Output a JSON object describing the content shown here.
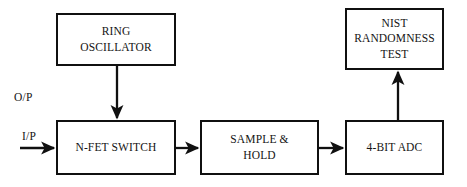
{
  "diagram": {
    "stroke_color": "#101010",
    "background_color": "#ffffff",
    "text_color": "#141414",
    "blocks": [
      {
        "id": "ring-oscillator",
        "label": "RING\nOSCILLATOR",
        "x": 56,
        "y": 13,
        "w": 120,
        "h": 53
      },
      {
        "id": "nist-randomness-test",
        "label": "NIST\nRANDOMNESS\nTEST",
        "x": 345,
        "y": 8,
        "w": 99,
        "h": 62
      },
      {
        "id": "n-fet-switch",
        "label": "N-FET SWITCH",
        "x": 56,
        "y": 120,
        "w": 120,
        "h": 55
      },
      {
        "id": "sample-and-hold",
        "label": "SAMPLE &\nHOLD",
        "x": 200,
        "y": 120,
        "w": 119,
        "h": 55
      },
      {
        "id": "four-bit-adc",
        "label": "4-BIT ADC",
        "x": 345,
        "y": 120,
        "w": 99,
        "h": 55
      }
    ],
    "edge_labels": [
      {
        "id": "output-label",
        "text": "O/P",
        "x": 14,
        "y": 91
      },
      {
        "id": "input-label",
        "text": "I/P",
        "x": 22,
        "y": 130
      }
    ],
    "connectors": [
      {
        "id": "input-to-n-fet-switch",
        "type": "arrow-right"
      },
      {
        "id": "ring-oscillator-to-n-fet-switch",
        "type": "arrow-down"
      },
      {
        "id": "n-fet-switch-to-sample-and-hold",
        "type": "arrow-right"
      },
      {
        "id": "sample-and-hold-to-four-bit-adc",
        "type": "arrow-right"
      },
      {
        "id": "four-bit-adc-to-nist-randomness-test",
        "type": "arrow-up"
      }
    ]
  }
}
